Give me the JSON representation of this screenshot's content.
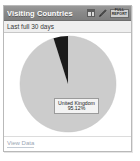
{
  "widget": {
    "title": "Visiting Countries",
    "subtitle": "Last full 30 days",
    "tools": {
      "table_icon": "table-grid-icon",
      "edit_icon": "pencil-icon",
      "badge_line1": "FULL",
      "badge_line2": "REPORT"
    },
    "footer": {
      "link_label": "View Data"
    },
    "colors": {
      "titlebar": "#8a8a8a",
      "subtitle_bg": "#efefef",
      "slice_major": "#cccccc",
      "slice_minor": "#1a1a1a",
      "label_bg": "#f3f3f3",
      "link": "#9aa6b4"
    }
  },
  "chart_data": {
    "type": "pie",
    "title": "Visiting Countries",
    "subtitle": "Last full 30 days",
    "categories": [
      "United Kingdom",
      "Other"
    ],
    "values": [
      95.12,
      4.88
    ],
    "unit": "%",
    "labels": [
      "95.12%",
      "4.88%"
    ],
    "colors": [
      "#cccccc",
      "#1a1a1a"
    ],
    "legend": "none",
    "annotation": {
      "name": "United Kingdom",
      "percent": "95.12%"
    },
    "start_angle_deg": -90,
    "radius_px": 48
  }
}
